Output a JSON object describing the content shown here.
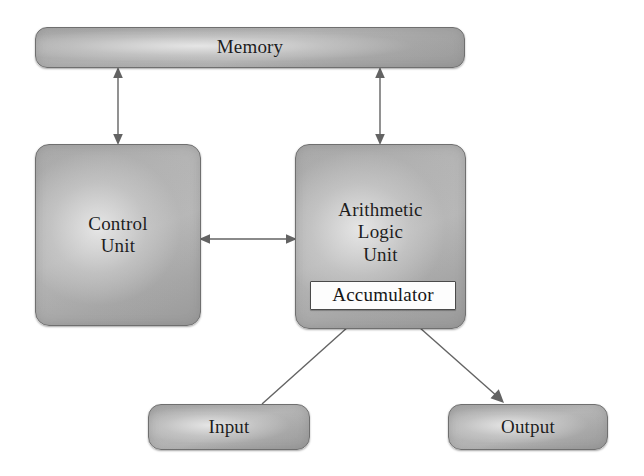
{
  "diagram": {
    "background_color": "#ffffff",
    "node_fill_color": "#b4b4b4",
    "node_border_color": "#6f6f6f",
    "accumulator_fill_color": "#fdfdfd",
    "edge_color": "#636363",
    "text_color": "#1d1d1d",
    "nodes": {
      "memory": {
        "label": "Memory"
      },
      "control_unit": {
        "line1": "Control",
        "line2": "Unit"
      },
      "alu": {
        "line1": "Arithmetic",
        "line2": "Logic",
        "line3": "Unit"
      },
      "accumulator": {
        "label": "Accumulator"
      },
      "input": {
        "label": "Input"
      },
      "output": {
        "label": "Output"
      }
    },
    "edges": [
      {
        "id": "memory-control-unit",
        "from": "Memory",
        "to": "Control Unit",
        "direction": "bidirectional",
        "orientation": "vertical"
      },
      {
        "id": "memory-alu",
        "from": "Memory",
        "to": "Arithmetic Logic Unit",
        "direction": "bidirectional",
        "orientation": "vertical"
      },
      {
        "id": "control-unit-alu",
        "from": "Control Unit",
        "to": "Arithmetic Logic Unit",
        "direction": "bidirectional",
        "orientation": "horizontal"
      },
      {
        "id": "input-accumulator",
        "from": "Input",
        "to": "Accumulator",
        "direction": "unidirectional",
        "orientation": "diagonal"
      },
      {
        "id": "alu-output",
        "from": "Arithmetic Logic Unit",
        "to": "Output",
        "direction": "unidirectional",
        "orientation": "diagonal"
      }
    ]
  }
}
